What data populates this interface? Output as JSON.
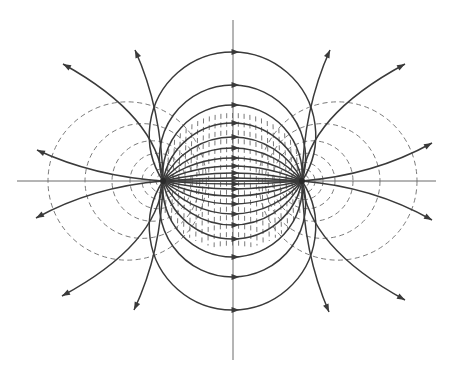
{
  "figure": {
    "width": 453,
    "height": 368,
    "colors": {
      "background": "#ffffff",
      "field_line": "#3a3a3a",
      "equipotential": "#7a7a7a",
      "axis": "#6a6a6a"
    }
  },
  "axes": {
    "horizontal": {
      "y": 181,
      "x1": 17,
      "x2": 436
    },
    "vertical": {
      "x": 233,
      "y1": 20,
      "y2": 360
    }
  },
  "charges": [
    {
      "name": "positive-charge",
      "x": 163,
      "y": 181
    },
    {
      "name": "negative-charge",
      "x": 302,
      "y": 181
    }
  ],
  "field_line_peaks": [
    52,
    85,
    105,
    123,
    137,
    148,
    158,
    166,
    173,
    178
  ],
  "open_field_lines": [
    {
      "side": "left",
      "end": [
        63,
        64
      ]
    },
    {
      "side": "left",
      "end": [
        135,
        50
      ]
    },
    {
      "side": "left",
      "end": [
        37,
        150
      ]
    },
    {
      "side": "left",
      "end": [
        36,
        218
      ]
    },
    {
      "side": "left",
      "end": [
        62,
        296
      ]
    },
    {
      "side": "left",
      "end": [
        134,
        310
      ]
    },
    {
      "side": "right",
      "end": [
        330,
        50
      ]
    },
    {
      "side": "right",
      "end": [
        405,
        64
      ]
    },
    {
      "side": "right",
      "end": [
        432,
        143
      ]
    },
    {
      "side": "right",
      "end": [
        432,
        220
      ]
    },
    {
      "side": "right",
      "end": [
        405,
        300
      ]
    },
    {
      "side": "right",
      "end": [
        329,
        312
      ]
    }
  ],
  "equipotential_left_x_outer": [
    48,
    85,
    112,
    130,
    142,
    150,
    156
  ],
  "equipotential_axis_ticks_count": 24
}
